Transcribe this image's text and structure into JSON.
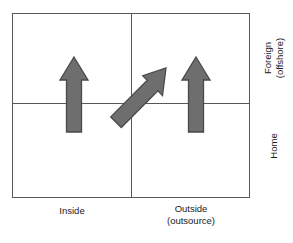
{
  "figure": {
    "type": "two-by-two-matrix-diagram",
    "background_color": "#ffffff",
    "frame": {
      "line_color": "#585858",
      "quadrant_count": 4
    },
    "axes": {
      "column_labels": [
        {
          "name": "inside",
          "primary": "Inside",
          "secondary": ""
        },
        {
          "name": "outside",
          "primary": "Outside",
          "secondary": "(outsource)"
        }
      ],
      "row_labels": [
        {
          "name": "foreign",
          "primary": "Foreign",
          "secondary": "(offshore)"
        },
        {
          "name": "home",
          "primary": "Home",
          "secondary": ""
        }
      ]
    },
    "arrows": {
      "fill_color": "#6e6e6e",
      "stroke_color": "#4a4a4a",
      "items": [
        {
          "name": "inside-home-to-foreign-arrow",
          "direction": "up",
          "from_quadrant": "Inside / Home",
          "to_quadrant": "Inside / Foreign (offshore)"
        },
        {
          "name": "inside-home-to-outside-foreign-arrow",
          "direction": "up-right",
          "from_quadrant": "Inside / Home",
          "to_quadrant": "Outside (outsource) / Foreign (offshore)"
        },
        {
          "name": "outside-home-to-foreign-arrow",
          "direction": "up",
          "from_quadrant": "Outside (outsource) / Home",
          "to_quadrant": "Outside (outsource) / Foreign (offshore)"
        }
      ]
    }
  }
}
